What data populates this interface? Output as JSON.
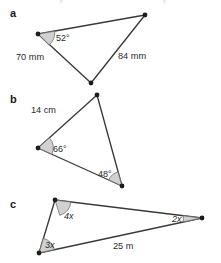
{
  "figure": {
    "background_color": "#ffffff",
    "stroke_color": "#3a3a3a",
    "wedge_fill_color": "#c9c9c9",
    "vertex_color": "#1c1c1c",
    "text_color": "#2b2b2b"
  },
  "parts": [
    {
      "key": "a",
      "label": "a",
      "side_labels": [
        "70 mm",
        "84 mm"
      ],
      "angle_labels": [
        "52°"
      ]
    },
    {
      "key": "b",
      "label": "b",
      "side_labels": [
        "14 cm"
      ],
      "angle_labels": [
        "66°",
        "48°"
      ]
    },
    {
      "key": "c",
      "label": "c",
      "side_labels": [
        "25 m"
      ],
      "angle_labels": [
        "4x",
        "3x",
        "2x"
      ]
    }
  ],
  "part_a": {
    "label": "a",
    "side_70": "70 mm",
    "side_84": "84 mm",
    "angle_52": "52°"
  },
  "part_b": {
    "label": "b",
    "side_14": "14 cm",
    "angle_66": "66°",
    "angle_48": "48°"
  },
  "part_c": {
    "label": "c",
    "side_25": "25 m",
    "angle_4x": "4x",
    "angle_3x": "3x",
    "angle_2x": "2x"
  }
}
